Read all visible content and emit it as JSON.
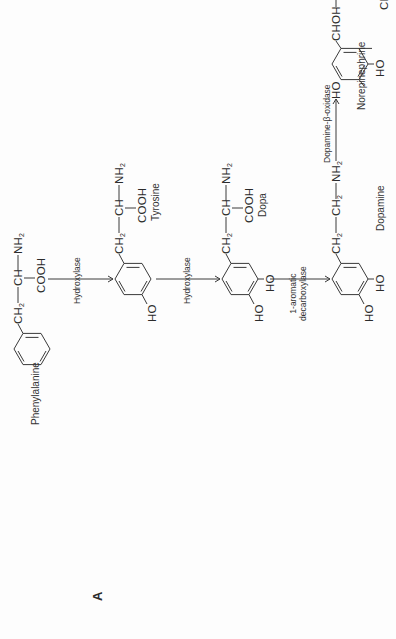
{
  "figure": {
    "panel_label": "A",
    "orientation": "rotated 90° counter-clockwise"
  },
  "compounds": [
    {
      "name": "Phenylalanine",
      "side_chain": [
        "CH2",
        "CH",
        "NH2"
      ],
      "carboxyl": "COOH",
      "ring_substituents": []
    },
    {
      "name": "Tyrosine",
      "side_chain": [
        "CH2",
        "CH",
        "NH2"
      ],
      "carboxyl": "COOH",
      "ring_substituents": [
        "HO"
      ]
    },
    {
      "name": "Dopa",
      "side_chain": [
        "CH2",
        "CH",
        "NH2"
      ],
      "carboxyl": "COOH",
      "ring_substituents": [
        "HO",
        "HO"
      ]
    },
    {
      "name": "Dopamine",
      "side_chain": [
        "CH2",
        "CH2",
        "NH2"
      ],
      "ring_substituents": [
        "HO",
        "HO"
      ]
    },
    {
      "name": "Norepinephrine",
      "side_chain": [
        "CHOH",
        "CH2",
        "NH2"
      ],
      "ring_substituents": [
        "HO",
        "HO"
      ]
    }
  ],
  "enzymes": [
    {
      "from": "Phenylalanine",
      "to": "Tyrosine",
      "label": "Hydroxylase"
    },
    {
      "from": "Tyrosine",
      "to": "Dopa",
      "label": "Hydroxylase"
    },
    {
      "from": "Dopa",
      "to": "Dopamine",
      "label_line1": "1-aromatic",
      "label_line2": "decarboxylase"
    },
    {
      "from": "Dopamine",
      "to": "Norepinephrine",
      "label": "Dopamine-β-oxidase"
    }
  ],
  "text": {
    "ch2": "CH",
    "ch": "CH",
    "nh": "NH",
    "chOH": "CHOH",
    "cooh": "COOH",
    "ho": "HO",
    "sub2": "2",
    "dash": "—"
  }
}
